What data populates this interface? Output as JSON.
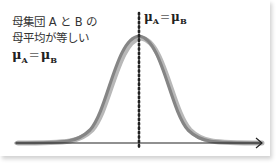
{
  "diagram": {
    "clipped_header_text": "",
    "description_lines": [
      "母集団 A と B の",
      "母平均が等しい"
    ],
    "left_equation": {
      "lhs": "μ",
      "lhs_sub": "A",
      "op": "=",
      "rhs": "μ",
      "rhs_sub": "B"
    },
    "peak_equation": {
      "lhs": "μ",
      "lhs_sub": "A",
      "op": "=",
      "rhs": "μ",
      "rhs_sub": "B"
    },
    "curves": [
      {
        "name": "population-A",
        "color": "#8a8a8a"
      },
      {
        "name": "population-B",
        "color": "#b4b4b4"
      }
    ],
    "axis_color": "#222222",
    "mean_line_style": "dotted"
  }
}
